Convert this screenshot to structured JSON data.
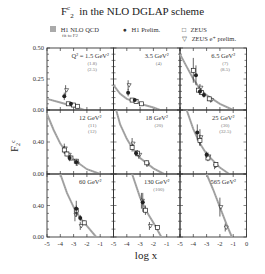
{
  "title": {
    "main": "F",
    "sup": "c",
    "sub": "2",
    "rest": "in the NLO DGLAP scheme"
  },
  "legend": [
    {
      "symbol": "grey-band",
      "label": "H1 NLO QCD",
      "sublabel": "fit to F2"
    },
    {
      "symbol": "filled-circle",
      "label": "H1 Prelim."
    },
    {
      "symbol": "open-square",
      "label": "ZEUS"
    },
    {
      "symbol": "open-triangle-down",
      "label": "ZEUS e⁺ prelim."
    }
  ],
  "chart_data": {
    "type": "scatter",
    "xlabel": "log x",
    "ylabel": "F2c",
    "xlim": [
      -5,
      0
    ],
    "x_ticks": [
      "-5",
      "-4",
      "-3",
      "-2",
      "-1"
    ],
    "x_ticks_last_col": [
      "-5",
      "-4",
      "-3",
      "-2",
      "-1",
      "0"
    ],
    "grid": false,
    "layout": "3x3 panels",
    "rows": [
      {
        "ylim": [
          0,
          0.5
        ],
        "y_ticks": [
          "0.50",
          "0.25",
          "0.00"
        ]
      },
      {
        "ylim": [
          0,
          0.8
        ],
        "y_ticks": [
          "0.40",
          "0.00"
        ]
      },
      {
        "ylim": [
          0,
          0.8
        ],
        "y_ticks": [
          "0.40",
          "0.00"
        ]
      }
    ],
    "panels": [
      {
        "label": "Q² = 1.5 GeV²",
        "extra": [
          "(1.8)",
          "(2.5)"
        ],
        "curve": [
          [
            -5,
            0.09
          ],
          [
            -4,
            0.06
          ],
          [
            -3,
            0.03
          ],
          [
            -2.2,
            0.0
          ]
        ],
        "h1": [
          [
            -3.7,
            0.11,
            0.03
          ],
          [
            -3.2,
            0.05,
            0.01
          ]
        ],
        "zeus": [
          [
            -3.4,
            0.05,
            0.01
          ],
          [
            -3.0,
            0.04,
            0.01
          ],
          [
            -2.7,
            0.03,
            0.01
          ]
        ],
        "zeus_e": [
          [
            -3.6,
            0.16,
            0.04
          ]
        ]
      },
      {
        "label": "3.5 GeV²",
        "extra": [
          "(4)"
        ],
        "curve": [
          [
            -5,
            0.2
          ],
          [
            -4.5,
            0.13
          ],
          [
            -4,
            0.09
          ],
          [
            -3,
            0.05
          ],
          [
            -2,
            0.02
          ],
          [
            -1.5,
            0.0
          ]
        ],
        "h1": [
          [
            -3.9,
            0.14,
            0.03
          ],
          [
            -3.4,
            0.08,
            0.01
          ]
        ],
        "zeus": [
          [
            -3.6,
            0.08,
            0.01
          ],
          [
            -3.3,
            0.07,
            0.01
          ],
          [
            -2.9,
            0.05,
            0.01
          ]
        ],
        "zeus_e": [
          [
            -3.9,
            0.2,
            0.04
          ]
        ]
      },
      {
        "label": "6.5 GeV²",
        "extra": [
          "(7)",
          "(8.5)"
        ],
        "curve": [
          [
            -5,
            0.45
          ],
          [
            -4.5,
            0.35
          ],
          [
            -4,
            0.25
          ],
          [
            -3.5,
            0.17
          ],
          [
            -3,
            0.12
          ],
          [
            -2,
            0.05
          ],
          [
            -1,
            0.0
          ]
        ],
        "h1": [
          [
            -3.8,
            0.28,
            0.08
          ],
          [
            -3.5,
            0.15,
            0.02
          ],
          [
            -3.2,
            0.12,
            0.02
          ]
        ],
        "zeus": [
          [
            -4.0,
            0.32,
            0.1
          ],
          [
            -3.6,
            0.16,
            0.02
          ],
          [
            -3.4,
            0.14,
            0.02
          ],
          [
            -2.8,
            0.09,
            0.02
          ]
        ],
        "zeus_e": [
          [
            -3.5,
            0.18,
            0.03
          ],
          [
            -2.7,
            0.08,
            0.02
          ]
        ]
      },
      {
        "label": "12 GeV²",
        "extra": [
          "(11)",
          "(12)"
        ],
        "curve": [
          [
            -5,
            0.75
          ],
          [
            -4.5,
            0.55
          ],
          [
            -4,
            0.38
          ],
          [
            -3.5,
            0.26
          ],
          [
            -3,
            0.18
          ],
          [
            -2,
            0.06
          ],
          [
            -1,
            0.0
          ]
        ],
        "h1": [
          [
            -3.3,
            0.2,
            0.04
          ],
          [
            -2.8,
            0.15,
            0.03
          ]
        ],
        "zeus": [
          [
            -3.7,
            0.3,
            0.05
          ],
          [
            -3.5,
            0.25,
            0.03
          ],
          [
            -3.2,
            0.2,
            0.03
          ],
          [
            -2.8,
            0.16,
            0.03
          ]
        ],
        "zeus_e": [
          [
            -3.7,
            0.32,
            0.06
          ],
          [
            -3.4,
            0.24,
            0.04
          ],
          [
            -2.8,
            0.13,
            0.03
          ]
        ]
      },
      {
        "label": "18 GeV²",
        "extra": [
          "(20)"
        ],
        "curve": [
          [
            -4.8,
            0.8
          ],
          [
            -4.5,
            0.62
          ],
          [
            -4,
            0.44
          ],
          [
            -3.5,
            0.3
          ],
          [
            -3,
            0.2
          ],
          [
            -2,
            0.07
          ],
          [
            -1.2,
            0.0
          ]
        ],
        "h1": [
          [
            -3.3,
            0.26,
            0.04
          ]
        ],
        "zeus": [
          [
            -3.6,
            0.33,
            0.05
          ],
          [
            -3.2,
            0.26,
            0.04
          ],
          [
            -2.5,
            0.14,
            0.03
          ]
        ],
        "zeus_e": [
          [
            -3.6,
            0.38,
            0.07
          ],
          [
            -3.1,
            0.24,
            0.05
          ],
          [
            -2.5,
            0.12,
            0.03
          ]
        ]
      },
      {
        "label": "25 GeV²",
        "extra": [
          "(30)",
          "(32.5)"
        ],
        "curve": [
          [
            -4.5,
            0.8
          ],
          [
            -4,
            0.56
          ],
          [
            -3.5,
            0.38
          ],
          [
            -3,
            0.25
          ],
          [
            -2,
            0.08
          ],
          [
            -1.3,
            0.0
          ]
        ],
        "h1": [
          [
            -3.7,
            0.52,
            0.1
          ],
          [
            -3.0,
            0.24,
            0.04
          ]
        ],
        "zeus": [
          [
            -3.5,
            0.42,
            0.07
          ],
          [
            -2.9,
            0.2,
            0.04
          ],
          [
            -2.3,
            0.12,
            0.03
          ]
        ],
        "zeus_e": [
          [
            -3.5,
            0.46,
            0.1
          ],
          [
            -2.9,
            0.22,
            0.05
          ],
          [
            -2.4,
            0.1,
            0.04
          ]
        ]
      },
      {
        "label": "60 GeV²",
        "extra": [],
        "curve": [
          [
            -4.0,
            0.8
          ],
          [
            -3.5,
            0.56
          ],
          [
            -3,
            0.38
          ],
          [
            -2.5,
            0.24
          ],
          [
            -2,
            0.14
          ],
          [
            -1.3,
            0.0
          ]
        ],
        "h1": [
          [
            -2.8,
            0.36,
            0.1
          ],
          [
            -2.5,
            0.24,
            0.04
          ]
        ],
        "zeus": [
          [
            -2.8,
            0.34,
            0.06
          ],
          [
            -2.2,
            0.18,
            0.03
          ]
        ],
        "zeus_e": [
          [
            -2.9,
            0.28,
            0.08
          ],
          [
            -2.5,
            0.14,
            0.05
          ]
        ]
      },
      {
        "label": "130 GeV²",
        "extra": [
          "(100)"
        ],
        "curve": [
          [
            -3.6,
            0.8
          ],
          [
            -3,
            0.5
          ],
          [
            -2.5,
            0.32
          ],
          [
            -2,
            0.18
          ],
          [
            -1.4,
            0.0
          ]
        ],
        "h1": [
          [
            -2.8,
            0.44,
            0.12
          ]
        ],
        "zeus": [
          [
            -2.6,
            0.34,
            0.06
          ],
          [
            -1.7,
            0.12,
            0.02
          ]
        ],
        "zeus_e": [
          [
            -2.9,
            0.46,
            0.1
          ],
          [
            -2.3,
            0.14,
            0.05
          ]
        ]
      },
      {
        "label": "565 GeV²",
        "extra": [],
        "curve": [
          [
            -3.0,
            0.8
          ],
          [
            -2.5,
            0.6
          ],
          [
            -2,
            0.38
          ],
          [
            -1.5,
            0.16
          ],
          [
            -1.1,
            0.0
          ]
        ],
        "h1": [],
        "zeus": [],
        "zeus_e": [
          [
            -2.0,
            0.38,
            0.12
          ],
          [
            -1.6,
            0.12,
            0.05
          ]
        ]
      }
    ]
  }
}
